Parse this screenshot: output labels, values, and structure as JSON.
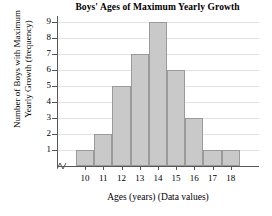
{
  "chart_data": {
    "type": "bar",
    "title": "Boys' Ages of Maximum Yearly Growth",
    "xlabel": "Ages (years) (Data values)",
    "ylabel_line1": "Number of Boys with Maximum",
    "ylabel_line2": "Yearly Growth (frequency)",
    "categories": [
      "10",
      "11",
      "12",
      "13",
      "14",
      "15",
      "16",
      "17",
      "18"
    ],
    "values": [
      1,
      2,
      5,
      7,
      9,
      6,
      3,
      1,
      1
    ],
    "ytick_labels": [
      "1",
      "2",
      "3",
      "4",
      "5",
      "6",
      "7",
      "8",
      "9"
    ],
    "ylim": [
      0,
      9
    ],
    "grid": true,
    "legend": "none",
    "bar_fill_color": "#c9c9c9",
    "bar_border_color": "#9a9a9a",
    "axis_color": "#565656",
    "gridline_color": "#e2e2e2",
    "axis_break": "yes"
  }
}
